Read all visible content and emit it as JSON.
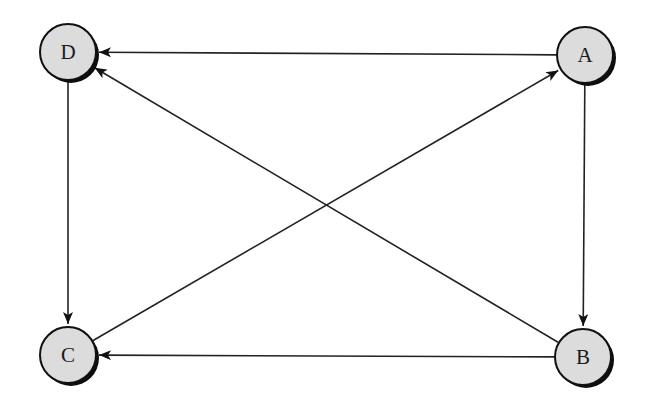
{
  "diagram": {
    "type": "directed-graph",
    "node_fill": "#dcdcdc",
    "edge_color": "#222222",
    "nodes": [
      {
        "id": "D",
        "label": "D",
        "cx": 68,
        "cy": 52
      },
      {
        "id": "A",
        "label": "A",
        "cx": 585,
        "cy": 55
      },
      {
        "id": "C",
        "label": "C",
        "cx": 68,
        "cy": 355
      },
      {
        "id": "B",
        "label": "B",
        "cx": 583,
        "cy": 357
      }
    ],
    "edges": [
      {
        "from": "A",
        "to": "D"
      },
      {
        "from": "B",
        "to": "D"
      },
      {
        "from": "A",
        "to": "B"
      },
      {
        "from": "D",
        "to": "C"
      },
      {
        "from": "B",
        "to": "C"
      },
      {
        "from": "C",
        "to": "A"
      }
    ]
  }
}
